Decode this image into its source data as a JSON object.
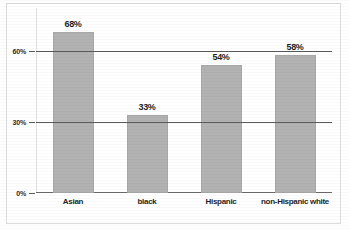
{
  "chart_data": {
    "type": "bar",
    "title": "",
    "subtitle": "",
    "xlabel": "",
    "ylabel": "",
    "categories": [
      "Asian",
      "black",
      "Hispanic",
      "non-Hispanic white"
    ],
    "values": [
      68,
      33,
      54,
      58
    ],
    "value_labels": [
      "68%",
      "33%",
      "54%",
      "58%"
    ],
    "ylim": [
      0,
      78
    ],
    "yticks": [
      0,
      30,
      60
    ],
    "ytick_labels": [
      "0%",
      "30%",
      "60%"
    ],
    "grid": true,
    "grid_axis": "y",
    "legend": false,
    "legend_position": "none",
    "orientation": "vertical",
    "bar_color": "#b2b2b2",
    "bar_edge_color": "#a8a8a8",
    "gridline_color": "#5a5a5a",
    "axis_color": "#6b6b6b",
    "text_color": "#1f1f1f",
    "background_color": "#ffffff"
  }
}
